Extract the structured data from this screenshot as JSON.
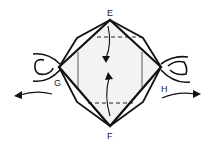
{
  "diagram": {
    "type": "origami-fold-step",
    "labels": {
      "top": "E",
      "bottom": "F",
      "left": "G",
      "right": "H"
    },
    "elements": {
      "outer_shape": "diamond with layered edges",
      "creases": [
        "dashed valley line near top",
        "dashed valley line near bottom",
        "vertical crease left",
        "vertical crease right"
      ],
      "arrows": [
        "fold down from E",
        "fold up from F",
        "pull left at G",
        "pull right at H"
      ],
      "loops": [
        "left loop at G",
        "right loop at H"
      ]
    },
    "colors": {
      "ink": "#111111",
      "paper": "#ffffff",
      "fill": "#f4f4f4"
    }
  }
}
